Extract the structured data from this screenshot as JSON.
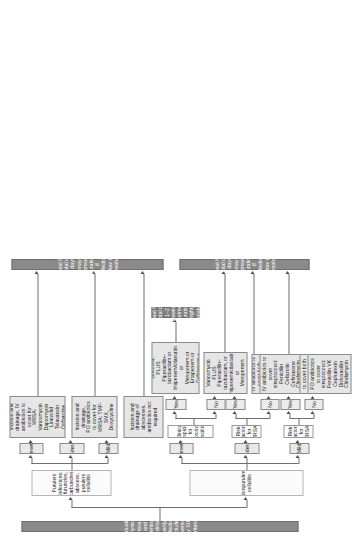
{
  "diagram": {
    "title_bar": "Evaluation, physical examination, and determination of clinical severity of infection including presence of any SIRS criteria",
    "branches": {
      "purulent": {
        "label": "Purulent infections: furuncles, carbuncles, abscess, purulent cellulitis",
        "severity": {
          "mild": "Mild",
          "moderate": "Moderate",
          "severe": "Severe"
        },
        "treatments": {
          "mild": "Incision and drainage of abscesses, antibiotics not required",
          "moderate": "Incision and drainage,\nPO antibiotics to cover for MRSA: TMP-SMX,\nDoxycycline",
          "severe": "Incision and drainage, IV antibiotics to cover for MRSA: Vancomycin\nDaptomycin Linezolid\nTelavancin Ceftaroline"
        },
        "duration": "Treat for total of 5 days; may increase duration if infection slow to resolve"
      },
      "nonpurulent": {
        "label": "Nonpurulent cellulitis",
        "severity": {
          "mild": "Mild",
          "moderate": "Moderate",
          "severe": "Severe"
        },
        "questions": {
          "mrsa_mild": "Risk factors for MRSA?",
          "mrsa_moderate": "Risk factors for MRSA?",
          "necrotizing": "Clinical suspicion for necrotizing fasciitis?"
        },
        "answers": {
          "yes": "Yes",
          "no": "No"
        },
        "treatments": {
          "mild_no": "PO antibiotics to cover streptococci:\nPenicillin VK\nCephalexin\nDicloxacillin\nClindamycin",
          "mild_yes": "PO antibiotics to cover both MRSA and streptococci:\nTMP-SMX or Doxycycline\nPLUS\nPenicillin or Amoxicillin",
          "moderate_no": "IV antibiotics to cover streptococci:\nPenicillin\nCefazolin\nCeftriaxone\nClindamycin",
          "moderate_yes": "IV antibiotics to cover both MRSA and streptococci:\nVancomycin\nDaptomycin\nTelavancin\nCeftaroline",
          "necrotizing_no": "Vancomycin\nPLUS\nPiperacillin–tazobactam, or\nImipenem/cilastatin, or\nMeropenem",
          "necrotizing_yes": "Vancomycin or Linezolid,\nPLUS\nPiperacillin–tazobactam or\nImipenem/cilastatin or\nMeropenem or\nErtapenem or\nCeftriaxone + Metronidazole"
        },
        "duration_standard": "Treat for total of 5 days; may increase duration if infection slow to resolve",
        "duration_necrotizing": "Treat for total of 1–2 weeks; treatment duration highly variable"
      }
    }
  }
}
